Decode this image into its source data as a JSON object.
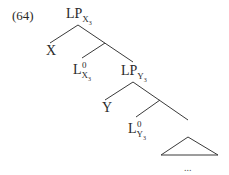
{
  "example_number": "(64)",
  "tree": {
    "root": {
      "base": "LP",
      "sub": "X",
      "subsub": "3"
    },
    "left_leaf_1": {
      "base": "X"
    },
    "head_1": {
      "base": "L",
      "sup": "0",
      "sub": "X",
      "subsub": "3"
    },
    "phrase_2": {
      "base": "LP",
      "sub": "Y",
      "subsub": "3"
    },
    "left_leaf_2": {
      "base": "Y"
    },
    "head_2": {
      "base": "L",
      "sup": "0",
      "sub": "Y",
      "subsub": "3"
    },
    "triangle_label": "..."
  },
  "colors": {
    "line": "#3a3a3a",
    "text": "#2a2a2a",
    "background": "#ffffff"
  }
}
